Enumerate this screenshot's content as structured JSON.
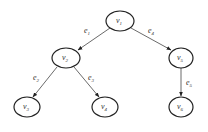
{
  "diagram": {
    "type": "tree",
    "nodes": [
      {
        "id": "v1",
        "base": "v",
        "sub": "1",
        "cx": 120,
        "cy": 21
      },
      {
        "id": "v2",
        "base": "v",
        "sub": "2",
        "cx": 66,
        "cy": 58
      },
      {
        "id": "v5",
        "base": "v",
        "sub": "5",
        "cx": 181,
        "cy": 58
      },
      {
        "id": "v3",
        "base": "v",
        "sub": "3",
        "cx": 27,
        "cy": 107
      },
      {
        "id": "v4",
        "base": "v",
        "sub": "4",
        "cx": 105,
        "cy": 107
      },
      {
        "id": "v6",
        "base": "v",
        "sub": "6",
        "cx": 181,
        "cy": 107
      }
    ],
    "edges": [
      {
        "id": "e1",
        "base": "e",
        "sub": "1",
        "from": "v1",
        "to": "v2"
      },
      {
        "id": "e4",
        "base": "e",
        "sub": "4",
        "from": "v1",
        "to": "v5"
      },
      {
        "id": "e2",
        "base": "e",
        "sub": "2",
        "from": "v2",
        "to": "v3"
      },
      {
        "id": "e3",
        "base": "e",
        "sub": "3",
        "from": "v2",
        "to": "v4"
      },
      {
        "id": "e5",
        "base": "e",
        "sub": "5",
        "from": "v5",
        "to": "v6"
      }
    ],
    "colors": {
      "stroke": "#222222",
      "edge": "#444444",
      "background": "#ffffff"
    }
  }
}
